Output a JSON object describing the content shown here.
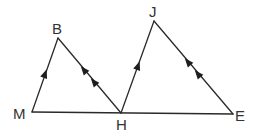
{
  "diagram": {
    "type": "geometry",
    "points": {
      "M": {
        "label": "M",
        "x": 32,
        "y": 112
      },
      "B": {
        "label": "B",
        "x": 58,
        "y": 38
      },
      "H": {
        "label": "H",
        "x": 121,
        "y": 113
      },
      "J": {
        "label": "J",
        "x": 154,
        "y": 21
      },
      "E": {
        "label": "E",
        "x": 233,
        "y": 114
      }
    },
    "segments": [
      {
        "from": "M",
        "to": "B",
        "parallel_marks": 1
      },
      {
        "from": "B",
        "to": "H",
        "parallel_marks": 2
      },
      {
        "from": "H",
        "to": "J",
        "parallel_marks": 1
      },
      {
        "from": "J",
        "to": "E",
        "parallel_marks": 2
      },
      {
        "from": "M",
        "to": "E",
        "parallel_marks": 0
      }
    ],
    "relationships": [
      "MB ∥ HJ",
      "BH ∥ JE"
    ],
    "colors": {
      "line": "#2a2a2a",
      "label": "#333333",
      "background": "#ffffff"
    }
  }
}
